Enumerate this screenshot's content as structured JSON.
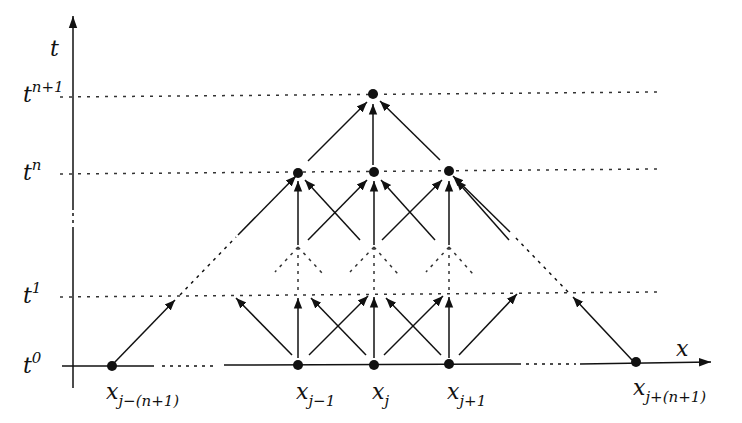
{
  "diagram": {
    "type": "space-time stencil / domain of dependence",
    "axes": {
      "time_axis_label": "t",
      "space_axis_label": "x"
    },
    "time_levels": [
      {
        "base": "t",
        "sup": "n+1",
        "y": 95
      },
      {
        "base": "t",
        "sup": "n",
        "y": 173
      },
      {
        "base": "t",
        "sup": "1",
        "y": 296
      },
      {
        "base": "t",
        "sup": "0",
        "y": 365
      }
    ],
    "space_nodes": [
      {
        "base": "x",
        "sub": "j−(n+1)",
        "x": 112
      },
      {
        "base": "x",
        "sub": "j−1",
        "x": 298
      },
      {
        "base": "x",
        "sub": "j",
        "x": 374
      },
      {
        "base": "x",
        "sub": "j+1",
        "x": 449
      },
      {
        "base": "x",
        "sub": "j+(n+1)",
        "x": 636
      }
    ],
    "colors": {
      "ink": "#111111",
      "dots": "#333333",
      "background": "#ffffff"
    }
  }
}
